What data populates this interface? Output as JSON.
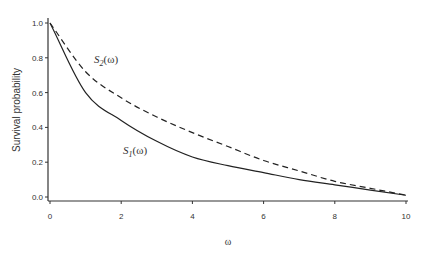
{
  "chart_data": {
    "type": "line",
    "title": "",
    "xlabel": "ω",
    "ylabel": "Survival probability",
    "xlim": [
      0,
      10
    ],
    "ylim": [
      0,
      1.0
    ],
    "x_ticks": [
      "0",
      "2",
      "4",
      "6",
      "8",
      "10"
    ],
    "y_ticks": [
      "0.0",
      "0.2",
      "0.4",
      "0.6",
      "0.8",
      "1.0"
    ],
    "grid": false,
    "legend": "none (inline curve labels)",
    "x": [
      0,
      1,
      2,
      3,
      4,
      5,
      6,
      7,
      8,
      9,
      10
    ],
    "series": [
      {
        "name": "S1(ω)",
        "style": "solid",
        "values": [
          1.0,
          0.6,
          0.44,
          0.32,
          0.23,
          0.18,
          0.14,
          0.1,
          0.07,
          0.04,
          0.01
        ]
      },
      {
        "name": "S2(ω)",
        "style": "dashed",
        "values": [
          1.0,
          0.72,
          0.57,
          0.46,
          0.37,
          0.29,
          0.21,
          0.15,
          0.09,
          0.05,
          0.01
        ]
      }
    ],
    "annotations": [
      {
        "text": "S2(ω)",
        "x": 1.4,
        "y": 0.83
      },
      {
        "text": "S1(ω)",
        "x": 1.7,
        "y": 0.3
      }
    ]
  }
}
